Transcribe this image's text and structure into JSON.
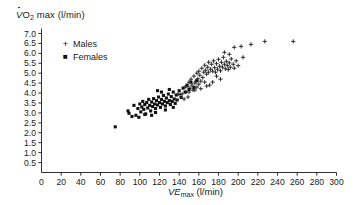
{
  "chart_data": {
    "type": "scatter",
    "title": "",
    "ylabel_parts": {
      "v": "V",
      "sub": "O",
      "sub2": "2",
      "rest": " max (l/min)"
    },
    "ylabel": "VO2 max (l/min)",
    "xlabel_parts": {
      "v": "VE",
      "sub": "max",
      "rest": " (l/min)"
    },
    "xlabel": "VEmax (l/min)",
    "xlim": [
      0,
      300
    ],
    "ylim": [
      0,
      7.25
    ],
    "xticks": [
      0,
      20,
      40,
      60,
      80,
      100,
      120,
      140,
      160,
      180,
      200,
      220,
      240,
      260,
      280,
      300
    ],
    "yticks": [
      0.5,
      1.0,
      1.5,
      2.0,
      2.5,
      3.0,
      3.5,
      4.0,
      4.5,
      5.0,
      5.5,
      6.0,
      6.5,
      7.0
    ],
    "xtick_labels": [
      "0",
      "20",
      "40",
      "60",
      "80",
      "100",
      "120",
      "140",
      "160",
      "180",
      "200",
      "220",
      "240",
      "260",
      "280",
      "300"
    ],
    "ytick_labels": [
      "0.5",
      "1.0",
      "1.5",
      "2.0",
      "2.5",
      "3.0",
      "3.5",
      "4.0",
      "4.5",
      "5.0",
      "5.5",
      "6.0",
      "6.5",
      "7.0"
    ],
    "grid": false,
    "legend_position": "upper-left-inside",
    "marker_color": "#111111",
    "series": [
      {
        "name": "Males",
        "marker": "plus",
        "points": [
          [
            139,
            3.95
          ],
          [
            141,
            3.92
          ],
          [
            143,
            3.95
          ],
          [
            145,
            3.7
          ],
          [
            146,
            4.3
          ],
          [
            147,
            4.05
          ],
          [
            148,
            4.35
          ],
          [
            149,
            3.8
          ],
          [
            150,
            4.55
          ],
          [
            151,
            4.25
          ],
          [
            152,
            4.7
          ],
          [
            153,
            4.4
          ],
          [
            154,
            4.15
          ],
          [
            155,
            4.85
          ],
          [
            156,
            4.5
          ],
          [
            157,
            4.6
          ],
          [
            158,
            4.3
          ],
          [
            158,
            5.0
          ],
          [
            159,
            4.72
          ],
          [
            160,
            4.45
          ],
          [
            160,
            5.1
          ],
          [
            161,
            4.9
          ],
          [
            162,
            4.6
          ],
          [
            163,
            5.25
          ],
          [
            164,
            4.78
          ],
          [
            165,
            5.05
          ],
          [
            166,
            4.55
          ],
          [
            166,
            5.4
          ],
          [
            167,
            5.15
          ],
          [
            168,
            4.95
          ],
          [
            169,
            5.3
          ],
          [
            170,
            5.05
          ],
          [
            170,
            5.55
          ],
          [
            171,
            4.4
          ],
          [
            172,
            5.2
          ],
          [
            173,
            5.45
          ],
          [
            174,
            5.1
          ],
          [
            175,
            5.62
          ],
          [
            176,
            5.28
          ],
          [
            177,
            5.05
          ],
          [
            178,
            5.48
          ],
          [
            179,
            5.2
          ],
          [
            180,
            5.7
          ],
          [
            181,
            5.35
          ],
          [
            182,
            5.12
          ],
          [
            183,
            5.55
          ],
          [
            184,
            5.3
          ],
          [
            185,
            5.8
          ],
          [
            186,
            5.45
          ],
          [
            187,
            5.22
          ],
          [
            188,
            5.6
          ],
          [
            189,
            5.38
          ],
          [
            190,
            5.18
          ],
          [
            191,
            5.52
          ],
          [
            192,
            5.3
          ],
          [
            193,
            5.72
          ],
          [
            195,
            5.45
          ],
          [
            196,
            5.25
          ],
          [
            198,
            5.62
          ],
          [
            200,
            5.38
          ],
          [
            186,
            6.05
          ],
          [
            191,
            5.95
          ],
          [
            196,
            6.3
          ],
          [
            203,
            6.35
          ],
          [
            205,
            5.8
          ],
          [
            213,
            6.45
          ],
          [
            227,
            6.6
          ],
          [
            256,
            6.6
          ],
          [
            150,
            4.05
          ],
          [
            162,
            4.22
          ],
          [
            174,
            4.55
          ],
          [
            178,
            4.85
          ],
          [
            182,
            4.7
          ],
          [
            168,
            4.35
          ],
          [
            156,
            4.15
          ]
        ]
      },
      {
        "name": "Females",
        "marker": "square",
        "points": [
          [
            75,
            2.3
          ],
          [
            88,
            3.1
          ],
          [
            89,
            2.98
          ],
          [
            92,
            2.82
          ],
          [
            94,
            3.38
          ],
          [
            96,
            2.88
          ],
          [
            98,
            3.22
          ],
          [
            99,
            2.78
          ],
          [
            100,
            3.45
          ],
          [
            101,
            3.05
          ],
          [
            102,
            3.3
          ],
          [
            103,
            3.58
          ],
          [
            104,
            3.18
          ],
          [
            105,
            3.42
          ],
          [
            106,
            2.95
          ],
          [
            107,
            3.52
          ],
          [
            108,
            3.25
          ],
          [
            109,
            3.68
          ],
          [
            110,
            3.38
          ],
          [
            111,
            3.1
          ],
          [
            112,
            3.55
          ],
          [
            113,
            3.32
          ],
          [
            114,
            3.72
          ],
          [
            115,
            3.45
          ],
          [
            116,
            3.22
          ],
          [
            117,
            3.62
          ],
          [
            118,
            3.4
          ],
          [
            119,
            3.8
          ],
          [
            120,
            3.52
          ],
          [
            121,
            3.28
          ],
          [
            122,
            3.68
          ],
          [
            123,
            3.45
          ],
          [
            124,
            3.88
          ],
          [
            125,
            3.58
          ],
          [
            126,
            3.35
          ],
          [
            127,
            3.75
          ],
          [
            128,
            3.52
          ],
          [
            129,
            3.95
          ],
          [
            130,
            3.62
          ],
          [
            131,
            3.42
          ],
          [
            132,
            3.82
          ],
          [
            133,
            3.58
          ],
          [
            134,
            4.05
          ],
          [
            135,
            3.7
          ],
          [
            136,
            3.48
          ],
          [
            137,
            3.9
          ],
          [
            138,
            3.65
          ],
          [
            140,
            4.12
          ],
          [
            142,
            3.78
          ],
          [
            144,
            4.25
          ],
          [
            146,
            4.05
          ],
          [
            148,
            4.4
          ],
          [
            150,
            4.18
          ],
          [
            152,
            4.55
          ],
          [
            155,
            4.28
          ],
          [
            158,
            4.62
          ],
          [
            118,
            4.12
          ],
          [
            122,
            4.05
          ],
          [
            130,
            4.18
          ],
          [
            105,
            2.92
          ],
          [
            112,
            2.88
          ],
          [
            116,
            3.02
          ],
          [
            126,
            3.15
          ],
          [
            134,
            3.28
          ]
        ]
      }
    ]
  }
}
